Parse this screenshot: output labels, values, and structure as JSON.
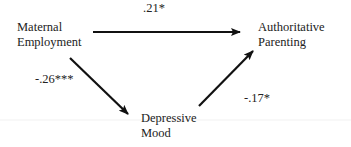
{
  "nodes": {
    "maternal_employment": {
      "line1": "Maternal",
      "line2": "Employment"
    },
    "authoritative_parenting": {
      "line1": "Authoritative",
      "line2": "Parenting"
    },
    "depressive_mood": {
      "line1": "Depressive",
      "line2": "Mood"
    }
  },
  "paths": {
    "employment_to_parenting": ".21*",
    "employment_to_mood": "-.26***",
    "mood_to_parenting": "-.17*"
  }
}
